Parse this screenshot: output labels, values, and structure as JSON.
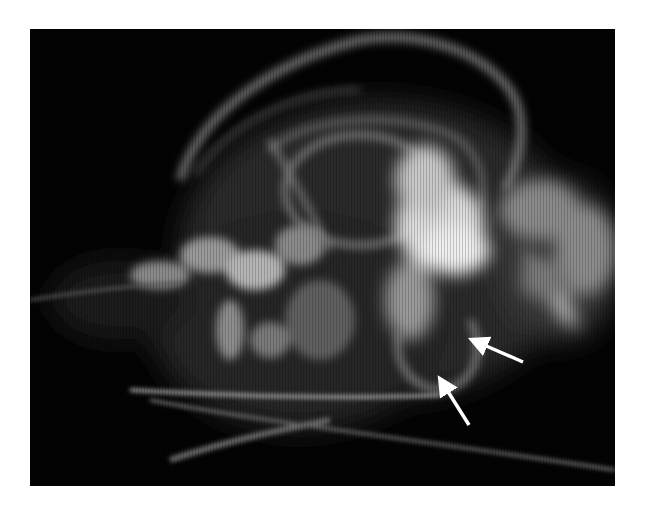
{
  "figure": {
    "kind": "radiograph",
    "background_color": "#030303",
    "page_background": "#ffffff",
    "annotations": [
      {
        "type": "arrow",
        "color": "#ffffff",
        "tip": [
          478,
          342
        ],
        "tail": [
          523,
          362
        ]
      },
      {
        "type": "arrow",
        "color": "#ffffff",
        "tip": [
          443,
          383
        ],
        "tail": [
          469,
          425
        ]
      }
    ]
  }
}
